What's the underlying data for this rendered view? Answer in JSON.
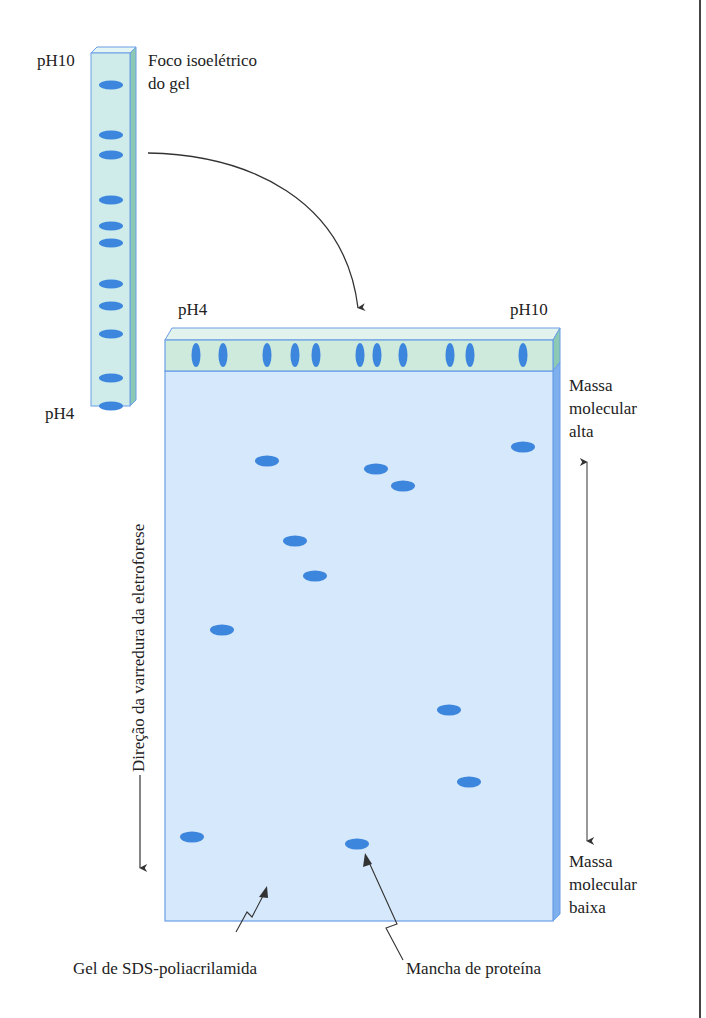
{
  "figure": {
    "type": "two-dimensional gel electrophoresis diagram",
    "colors": {
      "ief_strip_face": "#cfeceb",
      "ief_strip_side": "#8cc9b4",
      "gel_face": "#d6e8fb",
      "gel_side": "#7fb0ee",
      "gel_top_band": "#cdeadd",
      "outline": "#6a9ee6",
      "spot": "#3d86dd",
      "arrow": "#333333"
    }
  },
  "ief_strip": {
    "label_top_ph": "pH10",
    "label_bottom_ph": "pH4",
    "title_line1": "Foco isoelétrico",
    "title_line2": "do gel",
    "bands_y": [
      85,
      135,
      155,
      200,
      226,
      243,
      284,
      306,
      334,
      378,
      406
    ]
  },
  "sds_gel": {
    "label_left_ph": "pH4",
    "label_right_ph": "pH10",
    "top_bands_x": [
      196,
      223,
      267,
      295,
      316,
      360,
      377,
      403,
      450,
      470,
      523
    ],
    "spots": [
      {
        "x": 267,
        "y": 461
      },
      {
        "x": 376,
        "y": 469
      },
      {
        "x": 403,
        "y": 486
      },
      {
        "x": 523,
        "y": 447
      },
      {
        "x": 295,
        "y": 541
      },
      {
        "x": 315,
        "y": 576
      },
      {
        "x": 222,
        "y": 630
      },
      {
        "x": 449,
        "y": 710
      },
      {
        "x": 469,
        "y": 782
      },
      {
        "x": 192,
        "y": 837
      },
      {
        "x": 357,
        "y": 844
      }
    ],
    "high_mass_label": [
      "Massa",
      "molecular",
      "alta"
    ],
    "low_mass_label": [
      "Massa",
      "molecular",
      "baixa"
    ],
    "direction_label": "Direção da varredura da eletroforese",
    "gel_label": "Gel de SDS-poliacrilamida",
    "spot_label": "Mancha de proteína"
  }
}
